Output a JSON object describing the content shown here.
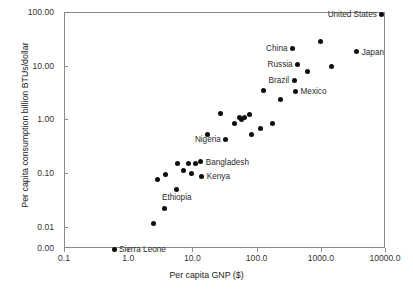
{
  "chart_data": {
    "type": "scatter",
    "title": "",
    "xlabel": "Per capita GNP ($)",
    "ylabel": "Per capita consumption billion BTUs/dollar",
    "xscale": "log",
    "yscale": "log",
    "xlim": [
      0.1,
      10000.0
    ],
    "ylim": [
      0.004,
      100.0
    ],
    "grid": false,
    "legend": "none",
    "xticklabels": [
      "0.1",
      "1.0",
      "10.0",
      "100.0",
      "1000.0",
      "10000.0"
    ],
    "xtickvalues": [
      0.1,
      1.0,
      10.0,
      100.0,
      1000.0,
      10000.0
    ],
    "yticklabels": [
      "100.00",
      "10.00",
      "1.00",
      "0.10",
      "0.01",
      "0.00"
    ],
    "ytickvalues": [
      100.0,
      10.0,
      1.0,
      0.1,
      0.01,
      0.0
    ],
    "points": [
      {
        "label": "Sierra Leone",
        "x": 0.58,
        "y": 0.004,
        "label_pos": "right"
      },
      {
        "label": "",
        "x": 2.4,
        "y": 0.0122,
        "label_pos": ""
      },
      {
        "label": "",
        "x": 3.6,
        "y": 0.0228,
        "label_pos": ""
      },
      {
        "label": "Ethiopia",
        "x": 5.5,
        "y": 0.052,
        "label_pos": "below"
      },
      {
        "label": "",
        "x": 2.8,
        "y": 0.079,
        "label_pos": ""
      },
      {
        "label": "",
        "x": 3.7,
        "y": 0.096,
        "label_pos": ""
      },
      {
        "label": "",
        "x": 7.1,
        "y": 0.118,
        "label_pos": ""
      },
      {
        "label": "",
        "x": 9.4,
        "y": 0.104,
        "label_pos": ""
      },
      {
        "label": "Kenya",
        "x": 13.5,
        "y": 0.091,
        "label_pos": "right"
      },
      {
        "label": "",
        "x": 5.6,
        "y": 0.155,
        "label_pos": ""
      },
      {
        "label": "",
        "x": 8.3,
        "y": 0.159,
        "label_pos": ""
      },
      {
        "label": "",
        "x": 10.6,
        "y": 0.158,
        "label_pos": ""
      },
      {
        "label": "Bangladesh",
        "x": 13.0,
        "y": 0.17,
        "label_pos": "right"
      },
      {
        "label": "",
        "x": 16.5,
        "y": 0.55,
        "label_pos": ""
      },
      {
        "label": "",
        "x": 26.0,
        "y": 1.35,
        "label_pos": ""
      },
      {
        "label": "Nigeria",
        "x": 32.0,
        "y": 0.44,
        "label_pos": "left"
      },
      {
        "label": "",
        "x": 44.0,
        "y": 0.88,
        "label_pos": ""
      },
      {
        "label": "",
        "x": 53.0,
        "y": 1.12,
        "label_pos": ""
      },
      {
        "label": "",
        "x": 57.0,
        "y": 1.02,
        "label_pos": ""
      },
      {
        "label": "",
        "x": 62.0,
        "y": 1.12,
        "label_pos": ""
      },
      {
        "label": "",
        "x": 76.0,
        "y": 1.27,
        "label_pos": ""
      },
      {
        "label": "",
        "x": 79.0,
        "y": 0.55,
        "label_pos": ""
      },
      {
        "label": "",
        "x": 110.0,
        "y": 0.7,
        "label_pos": ""
      },
      {
        "label": "",
        "x": 170.0,
        "y": 0.87,
        "label_pos": ""
      },
      {
        "label": "",
        "x": 125.0,
        "y": 3.6,
        "label_pos": ""
      },
      {
        "label": "",
        "x": 230.0,
        "y": 2.45,
        "label_pos": ""
      },
      {
        "label": "Mexico",
        "x": 390.0,
        "y": 3.5,
        "label_pos": "right"
      },
      {
        "label": "Brazil",
        "x": 370.0,
        "y": 5.6,
        "label_pos": "left"
      },
      {
        "label": "",
        "x": 600.0,
        "y": 8.2,
        "label_pos": ""
      },
      {
        "label": "Russia",
        "x": 420.0,
        "y": 11.0,
        "label_pos": "left"
      },
      {
        "label": "",
        "x": 1400.0,
        "y": 10.0,
        "label_pos": ""
      },
      {
        "label": "China",
        "x": 350.0,
        "y": 22.0,
        "label_pos": "left"
      },
      {
        "label": "",
        "x": 950.0,
        "y": 29.0,
        "label_pos": ""
      },
      {
        "label": "Japan",
        "x": 3500.0,
        "y": 19.0,
        "label_pos": "right"
      },
      {
        "label": "United States",
        "x": 8600.0,
        "y": 95.0,
        "label_pos": "left"
      }
    ]
  }
}
